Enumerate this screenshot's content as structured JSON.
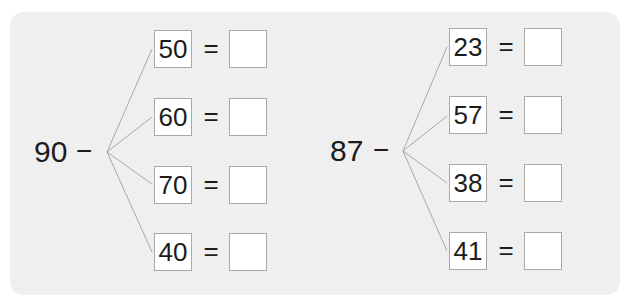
{
  "problems": [
    {
      "minuend": "90",
      "operator": "−",
      "subtrahends": [
        "50",
        "60",
        "70",
        "40"
      ],
      "equals": "=",
      "answers": [
        "",
        "",
        "",
        ""
      ]
    },
    {
      "minuend": "87",
      "operator": "−",
      "subtrahends": [
        "23",
        "57",
        "38",
        "41"
      ],
      "equals": "=",
      "answers": [
        "",
        "",
        "",
        ""
      ]
    }
  ],
  "colors": {
    "panel_background": "#efefef",
    "box_border": "#a9a9a9",
    "line_color": "#a8a8a8",
    "text_color": "#1c1c1c"
  }
}
